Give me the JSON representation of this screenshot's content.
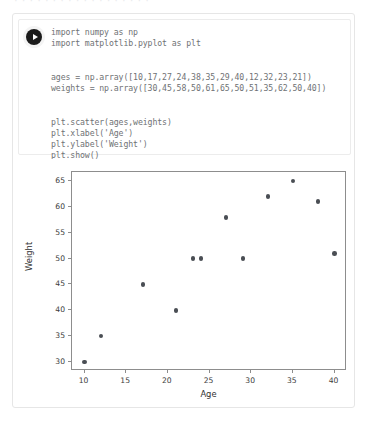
{
  "top_cut_text": "· · ·  · · ·  · · ·  · · ·  · · ·  · · ·",
  "cell": {
    "run_button_label": "Run cell",
    "code_lines": [
      "import numpy as np",
      "import matplotlib.pyplot as plt",
      "",
      "ages = np.array([10,17,27,24,38,35,29,40,12,32,23,21])",
      "weights = np.array([30,45,58,50,61,65,50,51,35,62,50,40])",
      "",
      "plt.scatter(ages,weights)",
      "plt.xlabel('Age')",
      "plt.ylabel('Weight')",
      "plt.show()"
    ]
  },
  "chart_data": {
    "type": "scatter",
    "title": "",
    "xlabel": "Age",
    "ylabel": "Weight",
    "x": [
      10,
      17,
      27,
      24,
      38,
      35,
      29,
      40,
      12,
      32,
      23,
      21
    ],
    "y": [
      30,
      45,
      58,
      50,
      61,
      65,
      50,
      51,
      35,
      62,
      50,
      40
    ],
    "series": [
      {
        "name": "ages vs weights",
        "points": [
          [
            10,
            30
          ],
          [
            17,
            45
          ],
          [
            27,
            58
          ],
          [
            24,
            50
          ],
          [
            38,
            61
          ],
          [
            35,
            65
          ],
          [
            29,
            50
          ],
          [
            40,
            51
          ],
          [
            12,
            35
          ],
          [
            32,
            62
          ],
          [
            23,
            50
          ],
          [
            21,
            40
          ]
        ]
      }
    ],
    "xlim": [
      8.5,
      41.5
    ],
    "ylim": [
      28.25,
      66.75
    ],
    "xticks": [
      10,
      15,
      20,
      25,
      30,
      35,
      40
    ],
    "yticks": [
      30,
      35,
      40,
      45,
      50,
      55,
      60,
      65
    ],
    "grid": false,
    "legend": false,
    "marker_color": "#4a4e54"
  },
  "colors": {
    "marker": "#4a4e54",
    "axis": "#8d8d8d",
    "card_border": "#e6e6e6",
    "code_text": "#6f7275"
  }
}
